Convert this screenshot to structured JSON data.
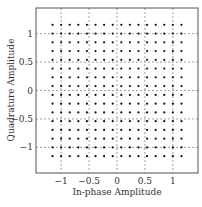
{
  "chart_data": {
    "type": "scatter",
    "title": "",
    "subtitle": "",
    "xlabel": "In-phase Amplitude",
    "ylabel": "Quadrature Amplitude",
    "xlim": [
      -1.45,
      1.45
    ],
    "ylim": [
      -1.45,
      1.45
    ],
    "grid": true,
    "grid_style": "dotted",
    "legend": null,
    "xticks": [
      -1,
      -0.5,
      0,
      0.5,
      1
    ],
    "xtick_labels": [
      "−1",
      "−0.5",
      "0",
      "0.5",
      "1"
    ],
    "yticks": [
      -1,
      -0.5,
      0,
      0.5,
      1
    ],
    "ytick_labels": [
      "−1",
      "−0.5",
      "0",
      "0.5",
      "1"
    ],
    "series": [
      {
        "name": "256-QAM constellation",
        "marker": "dot",
        "color": "#111111",
        "grid_levels": [
          -1.1538,
          -1.0,
          -0.8462,
          -0.6923,
          -0.5385,
          -0.3846,
          -0.2308,
          -0.0769,
          0.0769,
          0.2308,
          0.3846,
          0.5385,
          0.6923,
          0.8462,
          1.0,
          1.1538
        ],
        "description": "16 x 16 square grid of points; every combination of in-phase and quadrature level from grid_levels"
      }
    ]
  },
  "colors": {
    "frame": "#555555",
    "grid": "#777777",
    "points": "#111111",
    "background": "#ffffff"
  }
}
